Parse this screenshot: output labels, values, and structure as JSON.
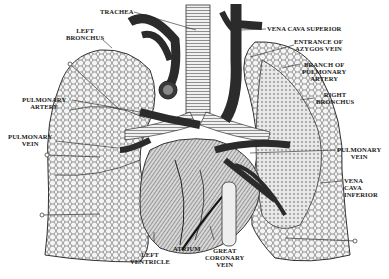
{
  "figure": {
    "colors": {
      "background": "#ffffff",
      "ink": "#1a1a1a",
      "vessel_dark": "#2b2b2b",
      "lung_fill": "#f2f2f2",
      "lung_mesh": "#555555",
      "heart_hatch": "#6a6a6a"
    },
    "labels": {
      "trachea": "TRACHEA",
      "left_bronchus_1": "LEFT",
      "left_bronchus_2": "BRONCHUS",
      "pulmonary_artery_1": "PULMONARY",
      "pulmonary_artery_2": "ARTERY",
      "pulmonary_vein_left_1": "PULMONARY",
      "pulmonary_vein_left_2": "VEIN",
      "vena_cava_superior": "VENA CAVA SUPERIOR",
      "azygos_1": "ENTRANCE OF",
      "azygos_2": "AZYGOS VEIN",
      "branch_pa_1": "BRANCH OF",
      "branch_pa_2": "PULMONARY",
      "branch_pa_3": "ARTERY",
      "right_bronchus_1": "RIGHT",
      "right_bronchus_2": "BRONCHUS",
      "pulmonary_vein_right_1": "PULMONARY",
      "pulmonary_vein_right_2": "VEIN",
      "vci_1": "VENA",
      "vci_2": "CAVA",
      "vci_3": "INFERIOR",
      "left_ventricle_1": "LEFT",
      "left_ventricle_2": "VENTRICLE",
      "atrium": "ATRIUM",
      "great_coronary_1": "GREAT",
      "great_coronary_2": "CORONARY",
      "great_coronary_3": "VEIN"
    }
  }
}
